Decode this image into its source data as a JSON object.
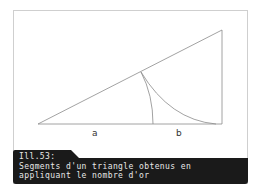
{
  "figure": {
    "labels": {
      "a": "a",
      "b": "b"
    },
    "colors": {
      "lines": "#8a8a8a",
      "caption_bg": "#1a1a1a",
      "caption_text": "#e8e8e8"
    }
  },
  "caption": {
    "number": "Ill.53:",
    "line1": "Segments d'un triangle obtenus en",
    "line2": "appliquant le nombre d'or"
  }
}
